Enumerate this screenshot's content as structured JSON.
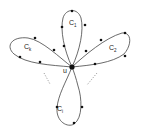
{
  "diagram": {
    "center_label": "u",
    "center": {
      "x": 72,
      "y": 67
    },
    "loops": [
      {
        "id": "C1",
        "label": "C",
        "subscript": "1",
        "label_pos": {
          "x": 70,
          "y": 24
        }
      },
      {
        "id": "C2",
        "label": "C",
        "subscript": "2",
        "label_pos": {
          "x": 111,
          "y": 48
        }
      },
      {
        "id": "Ck",
        "label": "C",
        "subscript": "k",
        "label_pos": {
          "x": 25,
          "y": 47
        }
      },
      {
        "id": "Ci",
        "label": "C",
        "subscript": "i",
        "label_pos": {
          "x": 57,
          "y": 111
        }
      }
    ],
    "ellipsis_marks": [
      "left-dotted",
      "right-dotted"
    ],
    "colors": {
      "stroke": "#333333",
      "node": "#111111"
    }
  }
}
